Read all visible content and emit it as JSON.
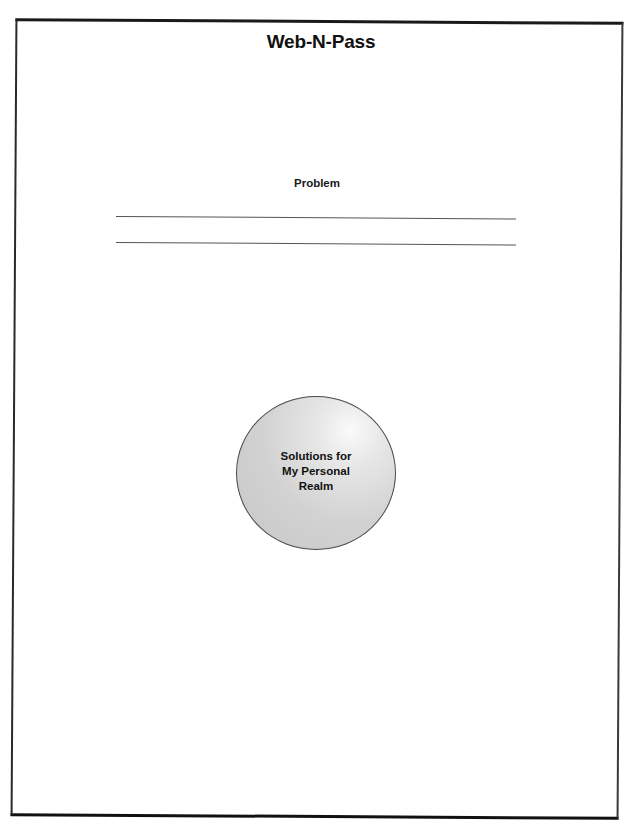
{
  "document": {
    "title": "Web-N-Pass",
    "problem_label": "Problem",
    "answer_lines": 2,
    "circle": {
      "lines": [
        "Solutions for",
        "My Personal",
        "Realm"
      ],
      "fill_color": "#d2d2d2",
      "border_color": "#4a4a4a"
    }
  }
}
